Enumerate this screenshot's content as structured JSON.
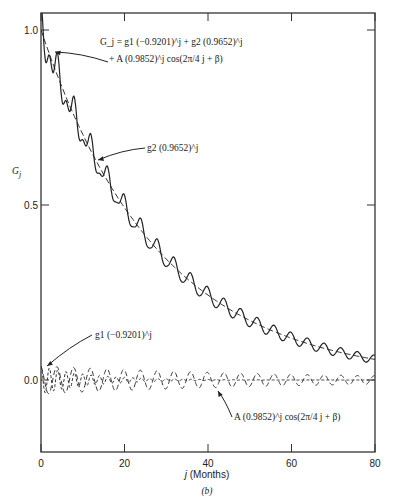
{
  "chart_data": {
    "type": "line",
    "title": "",
    "panel_label": "(b)",
    "xlabel": "j (Months)",
    "ylabel": "G_j",
    "xlim": [
      0,
      80
    ],
    "ylim": [
      -0.2,
      1.05
    ],
    "x_ticks": [
      0,
      20,
      40,
      60,
      80
    ],
    "x_tick_labels": [
      "0",
      "20",
      "40",
      "60",
      "80"
    ],
    "y_ticks": [
      0.0,
      0.5,
      1.0
    ],
    "y_tick_labels": [
      "0.0",
      "0.5",
      "1.0"
    ],
    "grid": false,
    "legend": null,
    "params": {
      "g1": 0.04,
      "r1": -0.9201,
      "g2": 1.0,
      "r2": 0.9652,
      "A": 0.04,
      "rA": 0.9852,
      "period": 4,
      "beta": 0.3
    },
    "series": [
      {
        "name": "G_j = g1(-0.9201)^j + g2(0.9652)^j + A(0.9852)^j cos(2π/4 j + β)",
        "style": "solid",
        "x": [
          0,
          5,
          10,
          15,
          20,
          25,
          30,
          35,
          40,
          45,
          50,
          55,
          60,
          65,
          70,
          75,
          80
        ],
        "values": [
          1.08,
          0.84,
          0.7,
          0.59,
          0.49,
          0.42,
          0.35,
          0.29,
          0.25,
          0.21,
          0.17,
          0.15,
          0.12,
          0.11,
          0.09,
          0.08,
          0.06
        ]
      },
      {
        "name": "g2(0.9652)^j",
        "style": "dashed",
        "x": [
          0,
          10,
          20,
          30,
          40,
          50,
          60,
          70,
          80
        ],
        "values": [
          1.0,
          0.7,
          0.49,
          0.35,
          0.24,
          0.17,
          0.12,
          0.08,
          0.06
        ]
      },
      {
        "name": "g1(-0.9201)^j",
        "style": "dashed",
        "x": [
          0,
          5,
          10,
          15,
          20
        ],
        "values": [
          0.04,
          -0.026,
          0.017,
          -0.011,
          0.007
        ]
      },
      {
        "name": "A(0.9852)^j cos(2π/4 j + β)",
        "style": "dashed",
        "x": [
          0,
          20,
          40,
          60,
          80
        ],
        "values": [
          0.04,
          0.03,
          0.022,
          0.016,
          0.012
        ]
      }
    ],
    "annotations": [
      {
        "text_line1": "G_j = g1 (−0.9201)^j + g2 (0.9652)^j",
        "text_line2": "+ A (0.9852)^j cos(2π/4 j + β)",
        "points_to": "G_j curve near j=2"
      },
      {
        "text": "g2 (0.9652)^j",
        "points_to": "trend curve near j=14"
      },
      {
        "text": "g1 (−0.9201)^j",
        "points_to": "alternating component near j=0"
      },
      {
        "text": "A (0.9852)^j cos(2π/4 j + β)",
        "points_to": "periodic component near j=40"
      }
    ]
  },
  "labels": {
    "xlabel_j": "j",
    "xlabel_rest": " (Months)",
    "ylabel_main": "G",
    "ylabel_sub": "j",
    "panel": "(b)"
  }
}
